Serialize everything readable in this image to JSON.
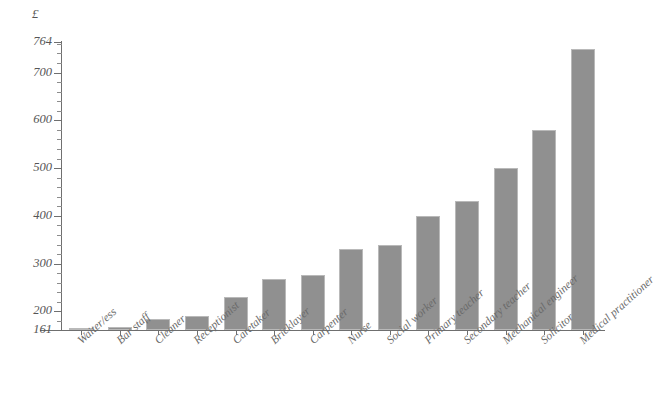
{
  "chart_data": {
    "type": "bar",
    "title": "",
    "subtitle": "",
    "xlabel": "",
    "ylabel": "",
    "unit_label": "£",
    "ylim": [
      161,
      764
    ],
    "ytick_labels": [
      "764",
      "700",
      "600",
      "500",
      "400",
      "300",
      "200",
      "161"
    ],
    "ytick_values": [
      764,
      700,
      600,
      500,
      400,
      300,
      200,
      161
    ],
    "yminor_step": 20,
    "grid": false,
    "legend": false,
    "bar_color": "#909090",
    "bar_edge_color": "#b9b9b9",
    "axis_color": "#6f6f6f",
    "text_color": "#6a6a6a",
    "categories": [
      "Waiter/ess",
      "Bar staff",
      "Cleaner",
      "Receptionist",
      "Caretaker",
      "Bricklayer",
      "Carpenter",
      "Nurse",
      "Social worker",
      "Primary teacher",
      "Secondary teacher",
      "Mechanical engineer",
      "Solicitor",
      "Medical practitioner"
    ],
    "values": [
      163,
      168,
      185,
      190,
      230,
      268,
      276,
      330,
      338,
      400,
      432,
      500,
      580,
      750
    ]
  }
}
